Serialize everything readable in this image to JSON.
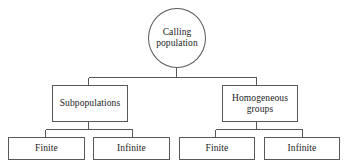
{
  "diagram": {
    "type": "tree-hierarchy",
    "orientation": "top-down",
    "stroke_color": "#595959",
    "fill_color": "#ffffff",
    "text_color": "#1b1b1b",
    "root": {
      "shape": "ellipse",
      "label": "Calling population",
      "line_1": "Calling",
      "line_2": "population"
    },
    "level_2": [
      {
        "shape": "rectangle",
        "label": "Subpopulations",
        "line_1": "Subpopulations",
        "line_2": ""
      },
      {
        "shape": "rectangle",
        "label": "Homogeneous groups",
        "line_1": "Homogeneous",
        "line_2": "groups"
      }
    ],
    "level_3": [
      {
        "shape": "rectangle",
        "label": "Finite"
      },
      {
        "shape": "rectangle",
        "label": "Infinite"
      },
      {
        "shape": "rectangle",
        "label": "Finite"
      },
      {
        "shape": "rectangle",
        "label": "Infinite"
      }
    ]
  }
}
